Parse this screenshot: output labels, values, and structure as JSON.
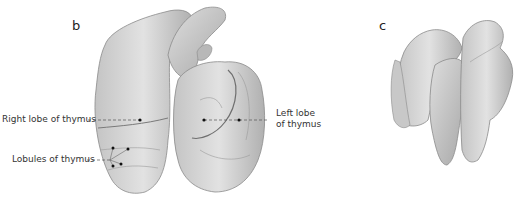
{
  "figure": {
    "panels": [
      {
        "letter": "b",
        "description": "Thymus (anterior view) with heart outline",
        "labels": [
          {
            "text": "Right lobe of thymus"
          },
          {
            "text": "Lobules of thymus"
          },
          {
            "text_line1": "Left lobe",
            "text_line2": "of thymus"
          }
        ]
      },
      {
        "letter": "c",
        "description": "Isolated thymus lobes"
      }
    ],
    "colors": {
      "organ_fill": "#d9d9d9",
      "organ_shadow": "#a9a9a9",
      "outline": "#8a8a8a",
      "leader_line": "#555555",
      "dot": "#111111"
    }
  }
}
